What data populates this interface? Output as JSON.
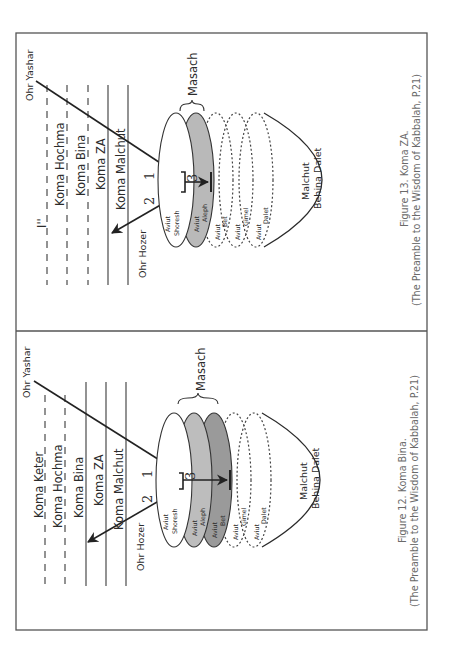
{
  "page": {
    "orientation": "rotated-90-ccw",
    "background": "#ffffff"
  },
  "figures": [
    {
      "id": "figure-13",
      "caption_line1": "Figure 13. Koma ZA.",
      "caption_line2": "(The Preamble to the Wisdom of Kabbalah, P.21)",
      "levels": [
        {
          "label": "I''",
          "style": "dashed"
        },
        {
          "label": "Koma Hochma",
          "style": "dashed"
        },
        {
          "label": "Koma Bina",
          "style": "dashed"
        },
        {
          "label": "Koma ZA",
          "style": "solid"
        },
        {
          "label": "Koma Malchut",
          "style": "solid"
        }
      ],
      "ohr_yashar": "Ohr Yashar",
      "ohr_hozer": "Ohr Hozer",
      "masach": "Masach",
      "step_1": "1",
      "step_2": "2",
      "step_3": "3",
      "aviut": [
        {
          "line1": "Aviut",
          "line2": "Shoresh",
          "fill": "#ffffff",
          "style": "solid"
        },
        {
          "line1": "Aviut",
          "line2": "Aleph",
          "fill": "#b9b9b9",
          "style": "solid"
        },
        {
          "line1": "Aviut",
          "line2": "Bet",
          "fill": "none",
          "style": "dotted"
        },
        {
          "line1": "Aviut",
          "line2": "Gimel",
          "fill": "none",
          "style": "dotted"
        },
        {
          "line1": "Aviut",
          "line2": "Dalet",
          "fill": "none",
          "style": "dotted"
        }
      ],
      "malchut_line1": "Malchut",
      "malchut_line2": "Behina Dalet"
    },
    {
      "id": "figure-12",
      "caption_line1": "Figure 12. Koma Bina.",
      "caption_line2": "(The Preamble to the Wisdom of Kabbalah, P.21)",
      "levels": [
        {
          "label": "Koma Keter",
          "style": "dashed"
        },
        {
          "label": "Koma Hochma",
          "style": "dashed"
        },
        {
          "label": "Koma Bina",
          "style": "solid"
        },
        {
          "label": "Koma ZA",
          "style": "solid"
        },
        {
          "label": "Koma Malchut",
          "style": "solid"
        }
      ],
      "ohr_yashar": "Ohr Yashar",
      "ohr_hozer": "Ohr Hozer",
      "masach": "Masach",
      "step_1": "1",
      "step_2": "2",
      "step_3": "3",
      "aviut": [
        {
          "line1": "Aviut",
          "line2": "Shoresh",
          "fill": "#ffffff",
          "style": "solid"
        },
        {
          "line1": "Aviut",
          "line2": "Aleph",
          "fill": "#bdbdbd",
          "style": "solid"
        },
        {
          "line1": "Aviut",
          "line2": "Bet",
          "fill": "#9a9a9a",
          "style": "solid"
        },
        {
          "line1": "Aviut",
          "line2": "Gimel",
          "fill": "none",
          "style": "dotted"
        },
        {
          "line1": "Aviut",
          "line2": "Dalet",
          "fill": "none",
          "style": "dotted"
        }
      ],
      "malchut_line1": "Malchut",
      "malchut_line2": "Behina Dalet"
    }
  ]
}
